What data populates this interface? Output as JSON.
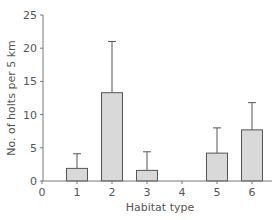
{
  "chart_data": {
    "type": "bar",
    "title": "",
    "xlabel": "Habitat type",
    "ylabel": "No. of holts per 5 km",
    "categories": [
      "1",
      "2",
      "3",
      "4",
      "5",
      "6"
    ],
    "values": [
      1.9,
      13.3,
      1.6,
      0,
      4.2,
      7.7
    ],
    "error_upper": [
      4.1,
      21.0,
      4.4,
      0,
      8.0,
      11.8
    ],
    "x_ticks": [
      "0",
      "1",
      "2",
      "3",
      "4",
      "5",
      "6"
    ],
    "y_ticks": [
      "0",
      "5",
      "10",
      "15",
      "20",
      "25"
    ],
    "ylim": [
      0,
      25
    ],
    "xlim": [
      0,
      6.5
    ],
    "grid": false,
    "legend": null,
    "colors": {
      "bar_fill": "#d9d9d9",
      "bar_stroke": "#555555",
      "axis": "#777777",
      "text": "#555555"
    }
  }
}
